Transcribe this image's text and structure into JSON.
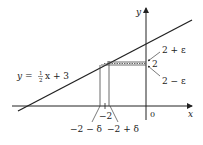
{
  "figure": {
    "equation_label": "y = ½x + 3",
    "eq_prefix": "y = ",
    "eq_num": "1",
    "eq_den": "2",
    "eq_suffix": "x + 3",
    "x_axis_label": "x",
    "y_axis_label": "y",
    "origin_label": "0",
    "x_tick_center": "−2",
    "x_tick_left": "−2 − δ",
    "x_tick_right": "−2 + δ",
    "y_tick_center": "2",
    "y_tick_upper": "2 + ε",
    "y_tick_lower": "2 − ε",
    "line_color": "#222222"
  }
}
